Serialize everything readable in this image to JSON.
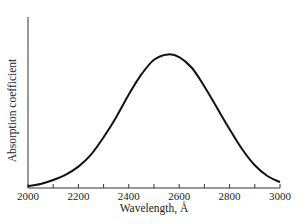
{
  "chart_data": {
    "type": "line",
    "title": "",
    "xlabel": "Wavelength, Å",
    "ylabel": "Absorption coefficient",
    "xlim": [
      2000,
      3000
    ],
    "ylim": [
      0,
      1.28
    ],
    "x_ticks_labeled": [
      2000,
      2200,
      2400,
      2600,
      2800,
      3000
    ],
    "x_ticks_minor": [
      2100,
      2300,
      2500,
      2700,
      2900
    ],
    "y_ticks": [],
    "grid": false,
    "legend": null,
    "series": [
      {
        "name": "absorption band",
        "x": [
          2000,
          2050,
          2100,
          2150,
          2200,
          2250,
          2300,
          2350,
          2400,
          2450,
          2500,
          2555,
          2600,
          2650,
          2700,
          2750,
          2800,
          2850,
          2900,
          2950,
          3000
        ],
        "y": [
          0.015,
          0.03,
          0.06,
          0.1,
          0.16,
          0.25,
          0.38,
          0.53,
          0.7,
          0.85,
          0.96,
          1.0,
          0.98,
          0.9,
          0.76,
          0.6,
          0.44,
          0.29,
          0.17,
          0.09,
          0.045
        ]
      }
    ],
    "y_units_note": "relative (no scale shown)"
  }
}
